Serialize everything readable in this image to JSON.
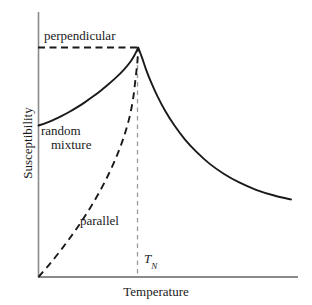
{
  "chart_data": {
    "type": "line",
    "title": "",
    "xlabel": "Temperature",
    "ylabel": "Susceptibility",
    "grid": false,
    "legend_position": "inline-annotations",
    "axis_style": "open-left-bottom-no-ticks",
    "xlim": [
      0,
      1
    ],
    "ylim": [
      0,
      1
    ],
    "annotations": [
      {
        "name": "perpendicular",
        "text": "perpendicular",
        "x": 0.02,
        "y": 0.95
      },
      {
        "name": "random-mixture",
        "text": "random mixture",
        "x": 0.02,
        "y": 0.62
      },
      {
        "name": "parallel",
        "text": "parallel",
        "x": 0.17,
        "y": 0.26
      },
      {
        "name": "neel-temperature",
        "text": "TN",
        "x": 0.42,
        "y": 0.07
      }
    ],
    "markers": {
      "neel_temperature_label": "T",
      "neel_temperature_subscript": "N",
      "neel_temperature_x": 0.385,
      "peak_y": 1.0
    },
    "series": [
      {
        "name": "random mixture",
        "style": "solid",
        "color": "#1a1a1a",
        "points": [
          [
            0.0,
            0.66
          ],
          [
            0.03,
            0.672
          ],
          [
            0.06,
            0.686
          ],
          [
            0.09,
            0.702
          ],
          [
            0.12,
            0.72
          ],
          [
            0.15,
            0.74
          ],
          [
            0.18,
            0.762
          ],
          [
            0.21,
            0.786
          ],
          [
            0.24,
            0.812
          ],
          [
            0.27,
            0.84
          ],
          [
            0.3,
            0.87
          ],
          [
            0.33,
            0.904
          ],
          [
            0.355,
            0.938
          ],
          [
            0.37,
            0.965
          ],
          [
            0.385,
            1.0
          ],
          [
            0.4,
            0.955
          ],
          [
            0.415,
            0.905
          ],
          [
            0.435,
            0.848
          ],
          [
            0.46,
            0.786
          ],
          [
            0.49,
            0.722
          ],
          [
            0.525,
            0.66
          ],
          [
            0.565,
            0.6
          ],
          [
            0.61,
            0.545
          ],
          [
            0.66,
            0.494
          ],
          [
            0.715,
            0.45
          ],
          [
            0.775,
            0.412
          ],
          [
            0.84,
            0.38
          ],
          [
            0.91,
            0.355
          ],
          [
            0.975,
            0.338
          ]
        ]
      },
      {
        "name": "parallel",
        "style": "dashed",
        "color": "#1a1a1a",
        "points": [
          [
            0.0,
            0.0
          ],
          [
            0.04,
            0.052
          ],
          [
            0.08,
            0.108
          ],
          [
            0.12,
            0.168
          ],
          [
            0.16,
            0.232
          ],
          [
            0.2,
            0.302
          ],
          [
            0.24,
            0.38
          ],
          [
            0.275,
            0.458
          ],
          [
            0.305,
            0.535
          ],
          [
            0.33,
            0.612
          ],
          [
            0.35,
            0.69
          ],
          [
            0.365,
            0.775
          ],
          [
            0.375,
            0.868
          ],
          [
            0.382,
            0.94
          ],
          [
            0.385,
            1.0
          ]
        ]
      }
    ],
    "guides": [
      {
        "name": "peak-horizontal-dashed",
        "orientation": "horizontal",
        "style": "dashed",
        "color": "#1a1a1a",
        "from": [
          0.0,
          1.0
        ],
        "to": [
          0.385,
          1.0
        ]
      },
      {
        "name": "neel-vertical-dashed",
        "orientation": "vertical",
        "style": "dashed",
        "color": "#9a9a9a",
        "from": [
          0.385,
          0.0
        ],
        "to": [
          0.385,
          1.0
        ]
      }
    ]
  },
  "axes": {
    "y_label": "Susceptibility",
    "x_label": "Temperature"
  },
  "labels": {
    "perpendicular": "perpendicular",
    "random": "random",
    "mixture": "mixture",
    "parallel": "parallel",
    "tn_symbol": "T",
    "tn_subscript": "N"
  },
  "colors": {
    "curve": "#1a1a1a",
    "axis": "#8a8a8a",
    "guide_gray": "#9a9a9a",
    "background": "#ffffff"
  }
}
